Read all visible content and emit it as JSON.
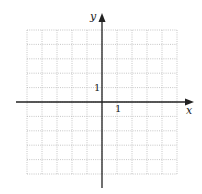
{
  "diagram": {
    "type": "coordinate-grid",
    "axes": {
      "x_label": "x",
      "y_label": "y"
    },
    "tick_labels": {
      "x_unit": "1",
      "y_unit": "1"
    },
    "grid": {
      "x_min": -5,
      "x_max": 5,
      "y_min": -5,
      "y_max": 5,
      "step": 1,
      "line_style": "dotted"
    },
    "colors": {
      "grid": "#b8b8b8",
      "axis": "#222222",
      "background": "#ffffff"
    }
  }
}
